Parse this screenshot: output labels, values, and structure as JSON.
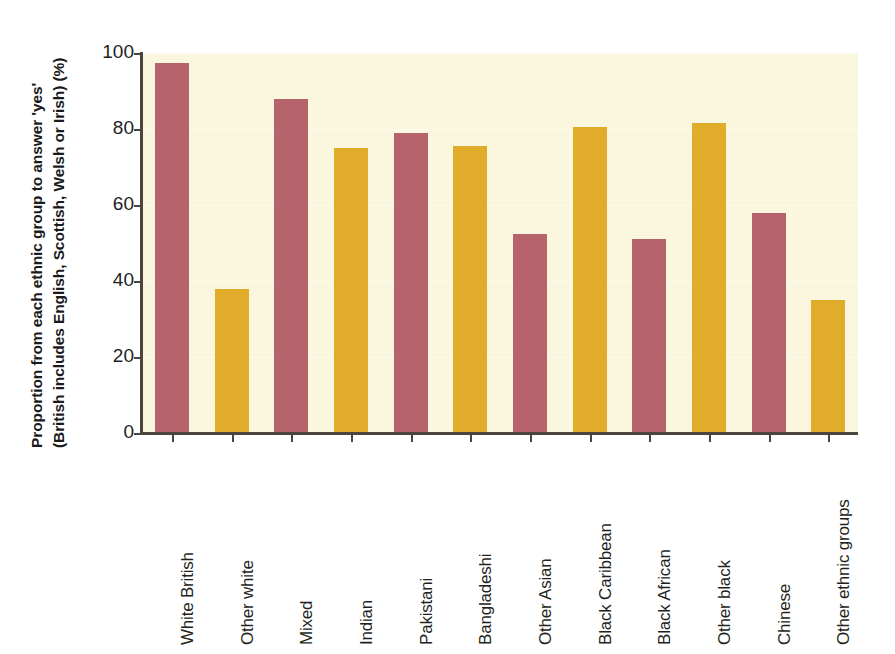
{
  "chart_data": {
    "type": "bar",
    "title": "",
    "subtitle": "",
    "xlabel": "",
    "ylabel_line1": "Proportion from each ethnic group to answer 'yes'",
    "ylabel_line2": "(British includes English, Scottish, Welsh or Irish) (%)",
    "ylim": [
      0,
      100
    ],
    "ytick_labels": [
      "100",
      "80",
      "60",
      "40",
      "20",
      "0"
    ],
    "ytick_values": [
      100,
      80,
      60,
      40,
      20,
      0
    ],
    "grid": true,
    "legend": "none",
    "categories": [
      "White British",
      "Other white",
      "Mixed",
      "Indian",
      "Pakistani",
      "Bangladeshi",
      "Other Asian",
      "Black Caribbean",
      "Black African",
      "Other black",
      "Chinese",
      "Other ethnic groups"
    ],
    "values": [
      97.5,
      38,
      88,
      75,
      79,
      75.5,
      52.5,
      80.5,
      51,
      81.5,
      58,
      35
    ],
    "bar_colors": [
      "#b6636c",
      "#e0ac2a",
      "#b6636c",
      "#e0ac2a",
      "#b6636c",
      "#e0ac2a",
      "#b6636c",
      "#e0ac2a",
      "#b6636c",
      "#e0ac2a",
      "#b6636c",
      "#e0ac2a"
    ]
  },
  "colors": {
    "bar_red": "#b6636c",
    "bar_gold": "#e0ac2a",
    "plot_background": "#fbf6de",
    "axis": "#4b4540",
    "text": "#231f1c",
    "page_background": "#ffffff"
  }
}
